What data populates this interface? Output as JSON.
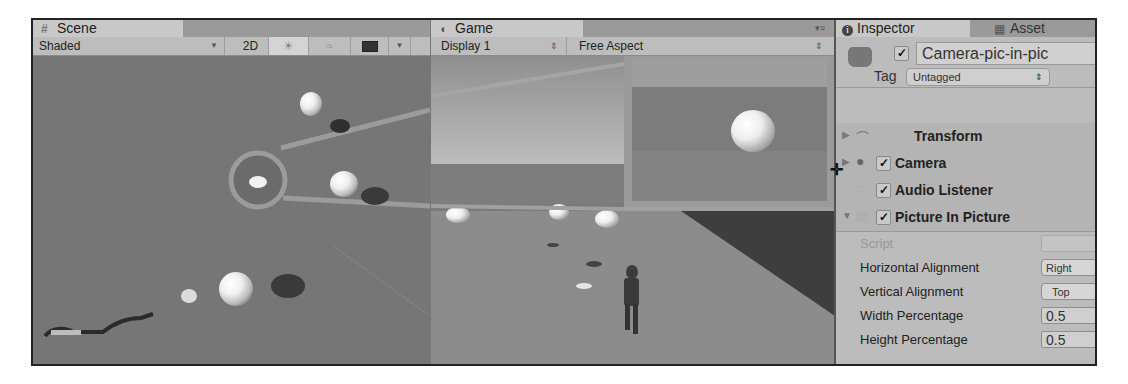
{
  "scene": {
    "tab_label": "Scene",
    "tab_icon": "grid-icon",
    "shading_mode": "Shaded",
    "mode_2d_label": "2D",
    "icons": [
      "lighting-icon",
      "audio-icon",
      "effects-icon",
      "dropdown-icon"
    ]
  },
  "game": {
    "tab_label": "Game",
    "tab_icon": "pacman-icon",
    "display": "Display 1",
    "aspect": "Free Aspect"
  },
  "inspector": {
    "tab_label": "Inspector",
    "tab_icon": "info-icon",
    "asset_tab_label": "Asset",
    "object_name": "Camera-pic-in-pic",
    "object_active": true,
    "tag_label": "Tag",
    "tag_value": "Untagged",
    "components": [
      {
        "name": "Transform",
        "has_checkbox": false,
        "expanded": false
      },
      {
        "name": "Camera",
        "has_checkbox": true,
        "checked": true,
        "expanded": false
      },
      {
        "name": "Audio Listener",
        "has_checkbox": true,
        "checked": true,
        "expanded": false
      },
      {
        "name": "Picture In Picture",
        "has_checkbox": true,
        "checked": true,
        "expanded": true
      }
    ],
    "properties": [
      {
        "label": "Script",
        "value": ""
      },
      {
        "label": "Horizontal Alignment",
        "value": "Right"
      },
      {
        "label": "Vertical Alignment",
        "value": "Top"
      },
      {
        "label": "Width Percentage",
        "value": "0.5"
      },
      {
        "label": "Height Percentage",
        "value": "0.5"
      }
    ]
  }
}
